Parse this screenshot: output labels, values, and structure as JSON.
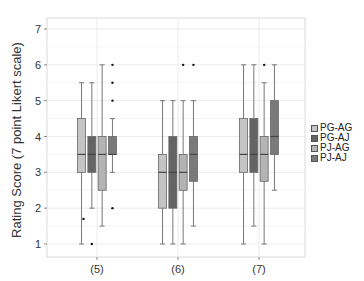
{
  "chart_data": {
    "type": "box",
    "title": "",
    "xlabel": "",
    "ylabel": "Rating Score (7 point Likert scale)",
    "ylim": [
      0.65,
      7.35
    ],
    "yticks": [
      1,
      2,
      3,
      4,
      5,
      6,
      7
    ],
    "grid": true,
    "legend_position": "right",
    "categories": [
      "(5)",
      "(6)",
      "(7)"
    ],
    "series": [
      {
        "name": "PG-AG",
        "color": "#c4c4c4",
        "boxes": [
          {
            "min": 1,
            "q1": 3,
            "median": 3.5,
            "q3": 4.5,
            "max": 5.5,
            "outliers": [
              1.7
            ]
          },
          {
            "min": 1,
            "q1": 2,
            "median": 3,
            "q3": 3.5,
            "max": 5,
            "outliers": []
          },
          {
            "min": 1,
            "q1": 3,
            "median": 3.5,
            "q3": 4.5,
            "max": 6,
            "outliers": []
          }
        ]
      },
      {
        "name": "PG-AJ",
        "color": "#646464",
        "boxes": [
          {
            "min": 2,
            "q1": 3,
            "median": 3.5,
            "q3": 4,
            "max": 5.5,
            "outliers": [
              1
            ]
          },
          {
            "min": 1,
            "q1": 2,
            "median": 3,
            "q3": 4,
            "max": 5,
            "outliers": []
          },
          {
            "min": 1.5,
            "q1": 3,
            "median": 3.5,
            "q3": 4.5,
            "max": 6,
            "outliers": []
          }
        ]
      },
      {
        "name": "PJ-AG",
        "color": "#b4b4b4",
        "boxes": [
          {
            "min": 1.5,
            "q1": 2.5,
            "median": 3.5,
            "q3": 4,
            "max": 6,
            "outliers": []
          },
          {
            "min": 1,
            "q1": 2.5,
            "median": 3,
            "q3": 3.5,
            "max": 5,
            "outliers": [
              6
            ]
          },
          {
            "min": 1,
            "q1": 2.75,
            "median": 3.5,
            "q3": 4,
            "max": 5.5,
            "outliers": [
              6
            ]
          }
        ]
      },
      {
        "name": "PJ-AJ",
        "color": "#7a7a7a",
        "boxes": [
          {
            "min": 3,
            "q1": 3.5,
            "median": 3.5,
            "q3": 4,
            "max": 4.5,
            "outliers": [
              6,
              5.5,
              5,
              2
            ]
          },
          {
            "min": 1.5,
            "q1": 2.75,
            "median": 3.5,
            "q3": 4,
            "max": 5,
            "outliers": [
              6
            ]
          },
          {
            "min": 2.5,
            "q1": 3.5,
            "median": 4,
            "q3": 5,
            "max": 6,
            "outliers": []
          }
        ]
      }
    ]
  }
}
